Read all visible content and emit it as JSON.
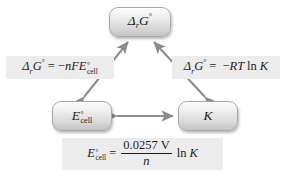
{
  "diagram": {
    "background_color": "#ffffff",
    "node_fill_color": "#d8d8d8",
    "node_border_color": "#a8a8a8",
    "label_plate_color": "#ececec",
    "arrow_color": "#8c8c8c",
    "text_color": "#1b1b1b"
  },
  "nodes": {
    "delta_g": {
      "id": "delta-r-g-standard",
      "symbol": "Δ",
      "sub": "r",
      "variable": "G",
      "superscript": "°",
      "plain": "ΔrG°"
    },
    "e_cell": {
      "id": "e-cell-standard",
      "variable": "E",
      "superscript": "°",
      "subscript": "cell",
      "plain": "E°cell"
    },
    "k": {
      "id": "equilibrium-constant",
      "variable": "K",
      "plain": "K"
    }
  },
  "formulas": {
    "left": {
      "id": "delta-g-equals-minus-nfe",
      "lhs_symbol": "Δ",
      "lhs_sub": "r",
      "lhs_variable": "G",
      "lhs_superscript": "°",
      "equals": "=",
      "rhs_sign": "−",
      "rhs_n": "n",
      "rhs_F": "F",
      "rhs_E": "E",
      "rhs_E_superscript": "°",
      "rhs_E_subscript": "cell",
      "plain": "ΔrG° = −nFE°cell"
    },
    "right": {
      "id": "delta-g-equals-minus-rt-ln-k",
      "lhs_symbol": "Δ",
      "lhs_sub": "r",
      "lhs_variable": "G",
      "lhs_superscript": "°",
      "equals": "=",
      "rhs_sign": "−",
      "rhs_R": "R",
      "rhs_T": "T",
      "rhs_ln": "ln",
      "rhs_K": "K",
      "plain": "ΔrG° = −RT ln K"
    },
    "bottom": {
      "id": "e-cell-equals-nernst-constant-over-n-ln-k",
      "lhs_E": "E",
      "lhs_superscript": "°",
      "lhs_subscript": "cell",
      "equals": "=",
      "numerator_value": "0.0257",
      "numerator_unit": "V",
      "denominator": "n",
      "ln": "ln",
      "K": "K",
      "plain": "E°cell = (0.0257 V / n) ln K"
    }
  },
  "arrows": [
    {
      "id": "arrow-ecell-deltag",
      "from": "e_cell",
      "to": "delta_g",
      "style": "double-headed"
    },
    {
      "id": "arrow-k-deltag",
      "from": "k",
      "to": "delta_g",
      "style": "double-headed"
    },
    {
      "id": "arrow-ecell-k",
      "from": "e_cell",
      "to": "k",
      "style": "double-headed"
    }
  ]
}
